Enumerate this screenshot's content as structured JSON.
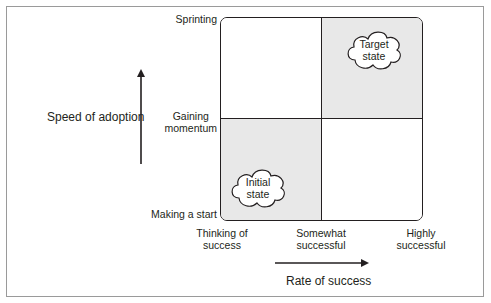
{
  "diagram": {
    "type": "2x2 quadrant matrix",
    "y_axis": {
      "title": "Speed of adoption",
      "levels": [
        "Making a start",
        "Gaining momentum",
        "Sprinting"
      ],
      "level_display": {
        "bottom": "Making a start",
        "middle_line1": "Gaining",
        "middle_line2": "momentum",
        "top": "Sprinting"
      }
    },
    "x_axis": {
      "title": "Rate of success",
      "levels": [
        "Thinking of success",
        "Somewhat successful",
        "Highly successful"
      ],
      "level_display": {
        "left_line1": "Thinking of",
        "left_line2": "success",
        "middle_line1": "Somewhat",
        "middle_line2": "successful",
        "right_line1": "Highly",
        "right_line2": "successful"
      }
    },
    "quadrants": {
      "top_left": {
        "shaded": false,
        "label": ""
      },
      "top_right": {
        "shaded": true,
        "label_line1": "Target",
        "label_line2": "state"
      },
      "bottom_left": {
        "shaded": true,
        "label_line1": "Initial",
        "label_line2": "state"
      },
      "bottom_right": {
        "shaded": false,
        "label": ""
      }
    },
    "colors": {
      "shade": "#e8e8e8",
      "line": "#231f20",
      "frame": "#9a9a9a"
    }
  }
}
